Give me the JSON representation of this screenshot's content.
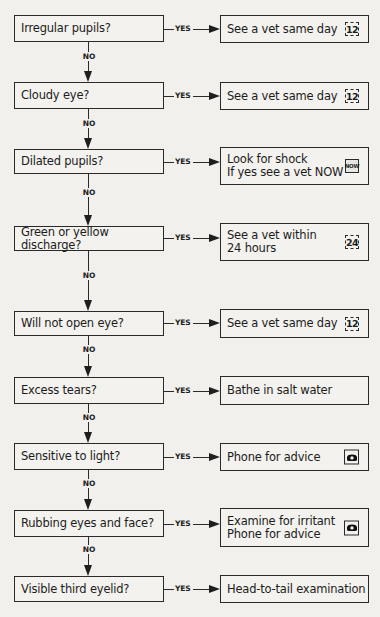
{
  "flowchart": {
    "yes_label": "YES",
    "no_label": "NO",
    "rows": [
      {
        "question": "Irregular pupils?",
        "answer": "See a vet same day",
        "icon": "clock-12-icon",
        "icon_text": "12"
      },
      {
        "question": "Cloudy eye?",
        "answer": "See a vet same day",
        "icon": "clock-12-icon",
        "icon_text": "12"
      },
      {
        "question": "Dilated pupils?",
        "answer": "Look for shock\nIf yes see a vet NOW",
        "icon": "now-icon",
        "icon_text": "NOW"
      },
      {
        "question": "Green or yellow discharge?",
        "answer": "See a vet within\n24 hours",
        "icon": "clock-24-icon",
        "icon_text": "24"
      },
      {
        "question": "Will not open eye?",
        "answer": "See a vet same day",
        "icon": "clock-12-icon",
        "icon_text": "12"
      },
      {
        "question": "Excess tears?",
        "answer": "Bathe in salt water",
        "icon": null,
        "icon_text": null
      },
      {
        "question": "Sensitive to light?",
        "answer": "Phone for advice",
        "icon": "phone-icon",
        "icon_text": null
      },
      {
        "question": "Rubbing eyes and face?",
        "answer": "Examine for irritant\nPhone for advice",
        "icon": "phone-icon",
        "icon_text": null
      },
      {
        "question": "Visible third eyelid?",
        "answer": "Head-to-tail examination",
        "icon": null,
        "icon_text": null
      }
    ]
  }
}
